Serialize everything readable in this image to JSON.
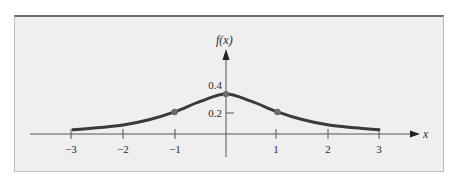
{
  "chart_data": {
    "type": "line",
    "title": "",
    "xlabel": "x",
    "ylabel": "f(x)",
    "xlim": [
      -3,
      3
    ],
    "ylim": [
      0,
      0.4
    ],
    "grid": false,
    "legend": null,
    "x_ticks": [
      "−3",
      "−2",
      "−1",
      "1",
      "2",
      "3"
    ],
    "y_ticks": [
      "0.2",
      "0.4"
    ],
    "series": [
      {
        "name": "f(x)",
        "x": [
          -3,
          -2.5,
          -2,
          -1.5,
          -1,
          -0.5,
          0,
          0.5,
          1,
          1.5,
          2,
          2.5,
          3
        ],
        "values": [
          0.04,
          0.06,
          0.085,
          0.135,
          0.21,
          0.31,
          0.38,
          0.31,
          0.21,
          0.135,
          0.085,
          0.06,
          0.04
        ]
      }
    ],
    "marked_points": [
      {
        "x": -1,
        "y": 0.21
      },
      {
        "x": 0,
        "y": 0.38
      },
      {
        "x": 1,
        "y": 0.21
      }
    ],
    "colors": {
      "curve": "#3a3a3a",
      "points": "#6b6b6b",
      "axis": "#555555",
      "panel": "#efefef"
    }
  },
  "labels": {
    "x_axis": "x",
    "y_axis": "f(x)",
    "xt": [
      "−3",
      "−2",
      "−1",
      "1",
      "2",
      "3"
    ],
    "yt": [
      "0.2",
      "0.4"
    ]
  }
}
